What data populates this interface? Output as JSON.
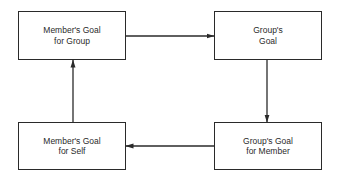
{
  "diagram": {
    "type": "cycle-flow",
    "nodes": [
      {
        "id": "members-goal-for-group",
        "line1": "Member's Goal",
        "line2": "for Group",
        "position": "top-left"
      },
      {
        "id": "groups-goal",
        "line1": "Group's",
        "line2": "Goal",
        "position": "top-right"
      },
      {
        "id": "groups-goal-for-member",
        "line1": "Group's Goal",
        "line2": "for Member",
        "position": "bottom-right"
      },
      {
        "id": "members-goal-for-self",
        "line1": "Member's Goal",
        "line2": "for Self",
        "position": "bottom-left"
      }
    ],
    "edges": [
      {
        "from": "members-goal-for-group",
        "to": "groups-goal",
        "direction": "right"
      },
      {
        "from": "groups-goal",
        "to": "groups-goal-for-member",
        "direction": "down"
      },
      {
        "from": "groups-goal-for-member",
        "to": "members-goal-for-self",
        "direction": "left"
      },
      {
        "from": "members-goal-for-self",
        "to": "members-goal-for-group",
        "direction": "up"
      }
    ],
    "colors": {
      "stroke": "#2a2a2a",
      "background": "#ffffff",
      "text": "#2a2a2a"
    }
  }
}
